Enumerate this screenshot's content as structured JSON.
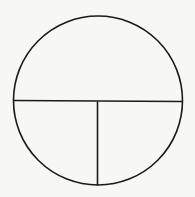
{
  "diagram": {
    "type": "divided-circle",
    "background": "#f7f7f5",
    "stroke_color": "#1a1a1a",
    "stroke_width": 1.6,
    "circle": {
      "cx": 98,
      "cy": 100.5,
      "r": 84.5
    },
    "horizontal_divider": {
      "x1": 13.5,
      "y1": 100.5,
      "x2": 182.5,
      "y2": 101.5
    },
    "vertical_divider": {
      "x1": 97.5,
      "y1": 101.5,
      "x2": 97.5,
      "y2": 185.5
    },
    "regions": [
      {
        "name": "top-half",
        "fraction": "1/2"
      },
      {
        "name": "bottom-left-quarter",
        "fraction": "1/4"
      },
      {
        "name": "bottom-right-quarter",
        "fraction": "1/4"
      }
    ]
  }
}
